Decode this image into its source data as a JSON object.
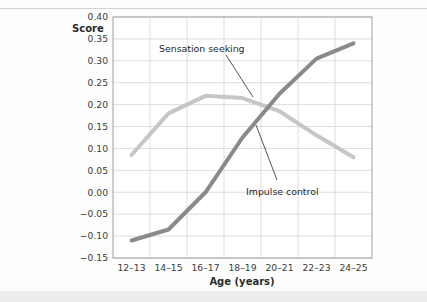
{
  "figure": {
    "background_color": "#fdfdfd",
    "top_rule_color": "#d2d2d2",
    "bottom_band_color": "#ededed"
  },
  "axes": {
    "y_axis_title": "Score",
    "x_axis_title": "Age (years)",
    "y_tick_labels": [
      "0.40",
      "0.35",
      "0.30",
      "0.25",
      "0.20",
      "0.15",
      "0.10",
      "0.05",
      "0.00",
      "−0.05",
      "−0.10",
      "−0.15"
    ],
    "x_tick_labels": [
      "12–13",
      "14–15",
      "16–17",
      "18–19",
      "20–21",
      "22–23",
      "24–25"
    ]
  },
  "annotations": [
    {
      "id": "sensation-seeking",
      "label": "Sensation seeking"
    },
    {
      "id": "impulse-control",
      "label": "Impulse control"
    }
  ],
  "chart_data": {
    "type": "line",
    "title": "",
    "xlabel": "Age (years)",
    "ylabel": "Score",
    "categories": [
      "12–13",
      "14–15",
      "16–17",
      "18–19",
      "20–21",
      "22–23",
      "24–25"
    ],
    "ylim": [
      -0.15,
      0.4
    ],
    "ytick_step": 0.05,
    "grid": true,
    "legend": "none",
    "annotations_inline": true,
    "series": [
      {
        "name": "Sensation seeking",
        "color": "#c6c6c6",
        "line_width": 4,
        "values": [
          0.085,
          0.18,
          0.22,
          0.215,
          0.185,
          0.13,
          0.08
        ]
      },
      {
        "name": "Impulse control",
        "color": "#8a8a8a",
        "line_width": 4,
        "values": [
          -0.11,
          -0.085,
          0.0,
          0.125,
          0.225,
          0.305,
          0.34
        ]
      }
    ]
  },
  "plot_geometry": {
    "left": 113,
    "right": 372,
    "top": 17,
    "bottom": 258,
    "grid_color": "#d9d9d9",
    "border_color": "#a8a8a8"
  }
}
